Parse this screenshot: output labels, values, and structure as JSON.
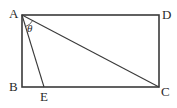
{
  "diagram": {
    "type": "geometry",
    "colors": {
      "stroke": "#3a3a3a",
      "text": "#2a2a2a",
      "background": "#ffffff"
    },
    "points": {
      "A": {
        "label": "A",
        "x": 22,
        "y": 15
      },
      "D": {
        "label": "D",
        "x": 159,
        "y": 15
      },
      "B": {
        "label": "B",
        "x": 22,
        "y": 87
      },
      "C": {
        "label": "C",
        "x": 159,
        "y": 87
      },
      "E": {
        "label": "E",
        "x": 44,
        "y": 87
      }
    },
    "segments": [
      "AD",
      "DC",
      "CB",
      "BA",
      "AC",
      "AE"
    ],
    "angle": {
      "label": "θ",
      "vertex": "A",
      "between": [
        "AE",
        "AC"
      ]
    }
  }
}
